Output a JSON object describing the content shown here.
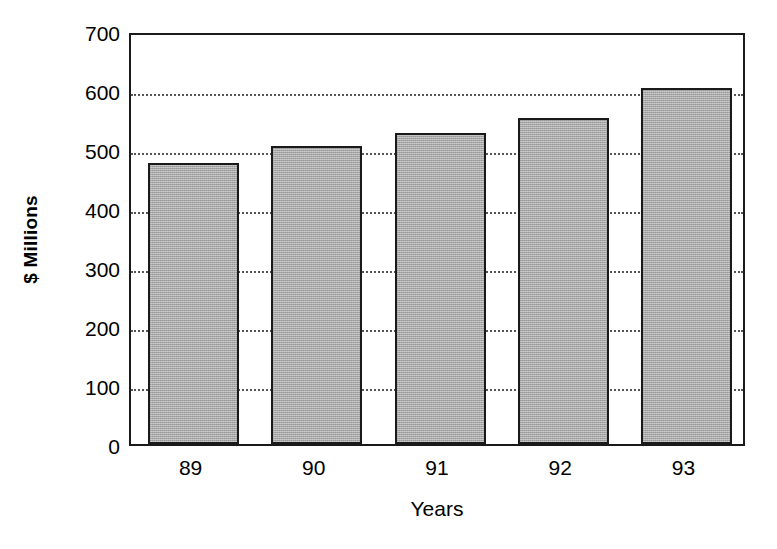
{
  "chart_data": {
    "type": "bar",
    "title": "",
    "subtitle": "",
    "xlabel": "Years",
    "ylabel": "$ Millions",
    "categories": [
      "89",
      "90",
      "91",
      "92",
      "93"
    ],
    "values": [
      477,
      505,
      527,
      553,
      603
    ],
    "series": [
      {
        "name": "$ Millions",
        "values": [
          477,
          505,
          527,
          553,
          603
        ]
      }
    ],
    "ylim": [
      0,
      700
    ],
    "yticks": [
      0,
      100,
      200,
      300,
      400,
      500,
      600,
      700
    ],
    "ytick_labels": [
      "0",
      "100",
      "200",
      "300",
      "400",
      "500",
      "600",
      "700"
    ],
    "grid": "horizontal-dotted",
    "legend": "none",
    "bar_fill_color": "#a9a9a9",
    "bar_edge_color": "#1a1a1a",
    "axis_color": "#1a1a1a",
    "grid_color": "#555555",
    "background_color": "#ffffff"
  }
}
